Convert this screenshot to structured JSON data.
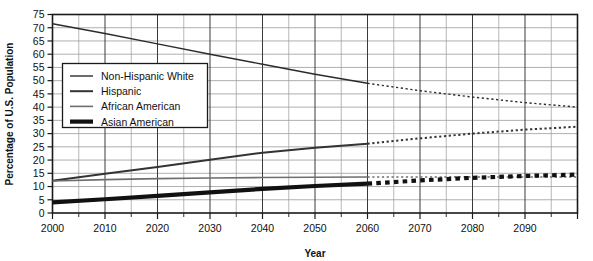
{
  "chart_data": {
    "type": "line",
    "title": "",
    "xlabel": "Year",
    "ylabel": "Percentage of U.S. Population",
    "xlim": [
      2000,
      2100
    ],
    "ylim": [
      0,
      75
    ],
    "xticks": [
      2000,
      2010,
      2020,
      2030,
      2040,
      2050,
      2060,
      2070,
      2080,
      2090
    ],
    "xtick_labels": [
      "2000",
      "2010",
      "2020",
      "2030",
      "2040",
      "2050",
      "2060",
      "2070",
      "2080",
      "2090"
    ],
    "yticks": [
      0,
      5,
      10,
      15,
      20,
      25,
      30,
      35,
      40,
      45,
      50,
      55,
      60,
      65,
      70,
      75
    ],
    "ytick_labels": [
      "0",
      "5",
      "10",
      "15",
      "20",
      "25",
      "30",
      "35",
      "40",
      "45",
      "50",
      "55",
      "60",
      "65",
      "70",
      "75"
    ],
    "minor_x_step": 5,
    "grid": "both",
    "legend_position": "upper-left-inside",
    "projection_start_year": 2060,
    "projection_style": "dotted",
    "series": [
      {
        "name": "Non-Hispanic White",
        "color": "#2b2b2b",
        "width": 1.4,
        "x": [
          2000,
          2010,
          2020,
          2030,
          2040,
          2050,
          2060,
          2070,
          2080,
          2090,
          2100
        ],
        "values": [
          71.5,
          67.8,
          63.9,
          60.0,
          56.2,
          52.4,
          49.0,
          46.2,
          43.8,
          41.7,
          40.0
        ]
      },
      {
        "name": "Hispanic",
        "color": "#333333",
        "width": 2.0,
        "x": [
          2000,
          2010,
          2020,
          2030,
          2040,
          2050,
          2060,
          2070,
          2080,
          2090,
          2100
        ],
        "values": [
          12.2,
          14.8,
          17.4,
          20.1,
          22.8,
          24.7,
          26.2,
          28.2,
          30.0,
          31.5,
          32.6
        ]
      },
      {
        "name": "African American",
        "color": "#6e6e6e",
        "width": 1.6,
        "x": [
          2000,
          2010,
          2020,
          2030,
          2040,
          2050,
          2060,
          2070,
          2080,
          2090,
          2100
        ],
        "values": [
          12.1,
          12.6,
          13.0,
          13.2,
          13.4,
          13.5,
          13.6,
          13.6,
          13.6,
          13.6,
          13.6
        ]
      },
      {
        "name": "Asian American",
        "color": "#111111",
        "width": 4.2,
        "x": [
          2000,
          2010,
          2020,
          2030,
          2040,
          2050,
          2060,
          2070,
          2080,
          2090,
          2100
        ],
        "values": [
          4.0,
          5.2,
          6.5,
          7.8,
          9.1,
          10.2,
          11.1,
          12.3,
          13.3,
          14.0,
          14.5
        ]
      }
    ]
  },
  "legend": {
    "entries": [
      {
        "label": "Non-Hispanic White"
      },
      {
        "label": "Hispanic"
      },
      {
        "label": "African American"
      },
      {
        "label": "Asian American"
      }
    ]
  }
}
